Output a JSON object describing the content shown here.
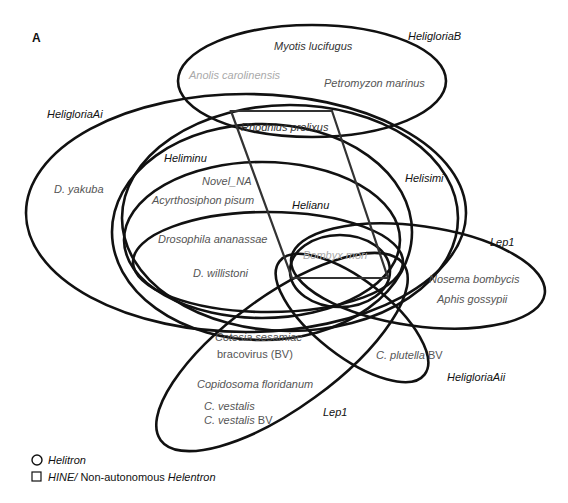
{
  "panel_label": "A",
  "groups": {
    "heligloria_b": "HeligloriaB",
    "heligloria_ai": "HeligloriaAi",
    "heligloria_aii": "HeligloriaAii",
    "heliminu": "Heliminu",
    "helisimi": "Helisimi",
    "helianu": "Helianu",
    "lep1_right": "Lep1",
    "lep1_lower": "Lep1",
    "novel_na": "Novel_NA"
  },
  "species": {
    "myotis": "Myotis lucifugus",
    "anolis": "Anolis carolinensis",
    "petromyzon": "Petromyzon marinus",
    "rhodnius": "Rhodnius prolixus",
    "d_yakuba": "D. yakuba",
    "acyrthosiphon": "Acyrthosiphon pisum",
    "drosophila_ananassae": "Drosophila ananassae",
    "d_willistoni": "D. willistoni",
    "bombyx": "Bombyx mori",
    "nosema": "Nosema bombycis",
    "aphis": "Aphis gossypii",
    "cotesia_line1": "Cotesia sesamiae",
    "cotesia_line2": "bracovirus (BV)",
    "c_plutella": "C. plutella",
    "c_plutella_suffix": " BV",
    "copidosoma": "Copidosoma floridanum",
    "c_vestalis": "C. vestalis",
    "c_vestalis_bv": "C. vestalis",
    "c_vestalis_bv_suffix": " BV"
  },
  "legend": {
    "circle_label": "Helitron",
    "square_label_italic": "HINE/",
    "square_label_plain": " Non-autonomous ",
    "square_label_italic2": "Helentron"
  },
  "colors": {
    "stroke": "#111111",
    "species_text": "#555555",
    "highlight_species_text": "#aaaaaa"
  }
}
